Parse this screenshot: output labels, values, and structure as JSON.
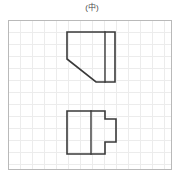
{
  "figure": {
    "caption": "(中)",
    "panel": {
      "border_color": "#b9b9b9",
      "grid_color": "#ececec",
      "grid_spacing_px": 12,
      "background_color": "#ffffff",
      "width_px": 164,
      "height_px": 150
    },
    "line_color": "#3a3a3a",
    "views": [
      {
        "name": "top-view",
        "label": "upper-orthographic-view",
        "description": "rectangle with chamfered lower-left corner and a vertical edge line near the right side",
        "outline_points": "58,11 106,11 106,61 87,61 58,38",
        "edge_line": "96,11 96,61"
      },
      {
        "name": "front-view",
        "label": "lower-orthographic-view",
        "description": "rectangle with a rectangular tab protruding on the right side and a vertical edge line inside",
        "outline_points": "58,90 96,90 96,98 107,98 107,121 96,121 96,133 58,133",
        "edge_line": "82,90 82,133"
      }
    ]
  }
}
